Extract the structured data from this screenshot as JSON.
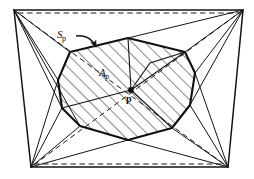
{
  "figure": {
    "caption_labels": {
      "outer_region": {
        "symbol": "S",
        "subscript": "p",
        "name": "S_p"
      },
      "inner_region": {
        "symbol": "A",
        "subscript": "p",
        "name": "A_p"
      },
      "center_point": {
        "symbol": "p",
        "subscript": "",
        "name": "p"
      }
    },
    "colors": {
      "stroke": "#141414",
      "hatch": "#303030",
      "background": "#ffffff",
      "point_fill": "#000000"
    },
    "geometry": {
      "outer_quadrilateral": [
        [
          14,
          10
        ],
        [
          243,
          10
        ],
        [
          228,
          167
        ],
        [
          31,
          167
        ]
      ],
      "inner_octagon": [
        [
          128,
          38
        ],
        [
          185,
          52
        ],
        [
          195,
          73
        ],
        [
          190,
          105
        ],
        [
          172,
          128
        ],
        [
          128,
          140
        ],
        [
          80,
          126
        ],
        [
          62,
          108
        ],
        [
          58,
          80
        ],
        [
          70,
          52
        ]
      ],
      "center_point": [
        131,
        90
      ],
      "point_marker_size": 5,
      "hatch_angle_deg": -45,
      "hatch_spacing_px": 9,
      "solid_spokes": [
        [
          [
            14,
            10
          ],
          [
            70,
            52
          ]
        ],
        [
          [
            14,
            10
          ],
          [
            58,
            80
          ]
        ],
        [
          [
            14,
            10
          ],
          [
            62,
            108
          ]
        ],
        [
          [
            14,
            10
          ],
          [
            80,
            126
          ]
        ],
        [
          [
            243,
            10
          ],
          [
            128,
            38
          ]
        ],
        [
          [
            243,
            10
          ],
          [
            185,
            52
          ]
        ],
        [
          [
            243,
            10
          ],
          [
            195,
            73
          ]
        ],
        [
          [
            243,
            10
          ],
          [
            190,
            105
          ]
        ],
        [
          [
            31,
            167
          ],
          [
            62,
            108
          ]
        ],
        [
          [
            31,
            167
          ],
          [
            80,
            126
          ]
        ],
        [
          [
            31,
            167
          ],
          [
            128,
            140
          ]
        ],
        [
          [
            228,
            167
          ],
          [
            190,
            105
          ]
        ],
        [
          [
            228,
            167
          ],
          [
            172,
            128
          ]
        ],
        [
          [
            228,
            167
          ],
          [
            128,
            140
          ]
        ]
      ],
      "dashed_lines": [
        [
          [
            14,
            10
          ],
          [
            228,
            167
          ]
        ],
        [
          [
            243,
            10
          ],
          [
            31,
            167
          ]
        ],
        [
          [
            14,
            10
          ],
          [
            243,
            10
          ]
        ],
        [
          [
            31,
            167
          ],
          [
            228,
            167
          ]
        ]
      ],
      "interior_rays": [
        [
          [
            131,
            90
          ],
          [
            128,
            38
          ]
        ],
        [
          [
            131,
            90
          ],
          [
            185,
            52
          ]
        ],
        [
          [
            131,
            90
          ],
          [
            62,
            108
          ]
        ],
        [
          [
            131,
            90
          ],
          [
            172,
            128
          ]
        ]
      ]
    },
    "arrow": {
      "name": "curved-arrow-sp",
      "from": [
        76,
        36
      ],
      "to": [
        96,
        47
      ],
      "control": [
        90,
        34
      ]
    }
  }
}
